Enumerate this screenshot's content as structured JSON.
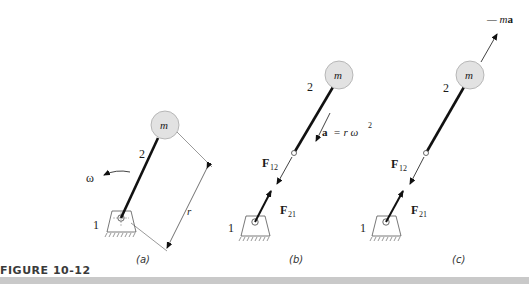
{
  "figure": {
    "label": "FIGURE 10-12",
    "colors": {
      "link": "#111111",
      "mass_fill": "#e0e0e0",
      "mass_stroke": "#999999",
      "bottom_bar": "#c9c9c9"
    }
  },
  "panels": [
    {
      "caption": "(a)",
      "mass_label": "m",
      "link_label": "2",
      "ground_label": "1",
      "omega_label": "ω",
      "radius_label": "r"
    },
    {
      "caption": "(b)",
      "mass_label": "m",
      "link_label": "2",
      "ground_label": "1",
      "accel_label": "a",
      "accel_eq": "= r ω",
      "accel_exp": "2",
      "f12_label": "F",
      "f12_sub": "12",
      "f21_label": "F",
      "f21_sub": "21"
    },
    {
      "caption": "(c)",
      "mass_label": "m",
      "link_label": "2",
      "ground_label": "1",
      "inertia_prefix": "— m",
      "inertia_bold": "a",
      "f12_label": "F",
      "f12_sub": "12",
      "f21_label": "F",
      "f21_sub": "21"
    }
  ]
}
